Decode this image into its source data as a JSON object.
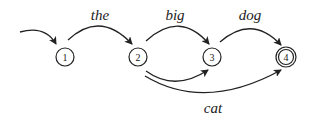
{
  "diagram": {
    "type": "finite-state-automaton",
    "states": [
      {
        "id": "1",
        "label": "1",
        "start": true,
        "final": false
      },
      {
        "id": "2",
        "label": "2",
        "start": false,
        "final": false
      },
      {
        "id": "3",
        "label": "3",
        "start": false,
        "final": false
      },
      {
        "id": "4",
        "label": "4",
        "start": false,
        "final": true
      }
    ],
    "transitions": [
      {
        "from": "1",
        "to": "2",
        "label": "the"
      },
      {
        "from": "2",
        "to": "3",
        "label": "big"
      },
      {
        "from": "3",
        "to": "4",
        "label": "dog"
      },
      {
        "from": "2",
        "to": "3",
        "label": ""
      },
      {
        "from": "2",
        "to": "4",
        "label": "cat"
      }
    ]
  }
}
